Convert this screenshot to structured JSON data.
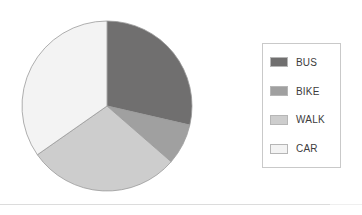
{
  "chart_data": {
    "type": "pie",
    "title": "",
    "categories": [
      "BUS",
      "BIKE",
      "WALK",
      "CAR"
    ],
    "values": [
      28.6,
      7.8,
      28.9,
      34.7
    ],
    "units": "percent",
    "start_angle_deg": 0,
    "direction": "clockwise",
    "slice_angles_deg": [
      103,
      28,
      104,
      125
    ],
    "colors": [
      "#706f6f",
      "#a0a0a0",
      "#cdcdcd",
      "#f3f3f3"
    ],
    "legend_position": "right",
    "grid": false,
    "xlabel": "",
    "ylabel": "",
    "labels_shown": false
  },
  "legend": {
    "items": [
      {
        "label": "BUS",
        "color": "#706f6f"
      },
      {
        "label": "BIKE",
        "color": "#a0a0a0"
      },
      {
        "label": "WALK",
        "color": "#cdcdcd"
      },
      {
        "label": "CAR",
        "color": "#f3f3f3"
      }
    ]
  },
  "style": {
    "slice_stroke": "#9b9b9b",
    "legend_border": "#c9c9c9",
    "swatch_border": "#b6b6b6",
    "rule_color": "#dcdcdc",
    "background": "#ffffff",
    "text_color": "#3c3c3c"
  },
  "geometry": {
    "center_x": 86,
    "center_y": 86,
    "radius": 85
  }
}
